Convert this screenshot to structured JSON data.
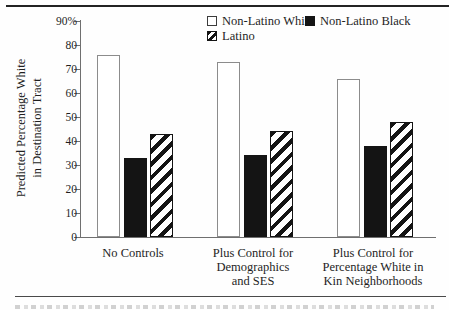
{
  "figure": {
    "type": "journal-figure",
    "colors": {
      "ink": "#1a1a1a",
      "axis_gray": "#6f6f6f",
      "bar_outline_gray": "#8c8c8c"
    }
  },
  "legend": {
    "position": "top-inside",
    "items": [
      {
        "label": "Non-Latino White",
        "swatch": "open"
      },
      {
        "label": "Non-Latino Black",
        "swatch": "solid"
      },
      {
        "label": "Latino",
        "swatch": "hatched"
      }
    ]
  },
  "axis": {
    "ylabel_line1": "Predicted Percentage White",
    "ylabel_line2": "in Destination Tract"
  },
  "chart_data": {
    "type": "bar",
    "title": "",
    "xlabel": "",
    "ylabel": "Predicted Percentage White in Destination Tract",
    "ylim": [
      0,
      90
    ],
    "ytick_interval": 10,
    "ytick_labels": [
      "90%",
      "80",
      "70",
      "60",
      "50",
      "40",
      "30",
      "20",
      "10",
      "0"
    ],
    "grid": false,
    "legend_position": "top",
    "categories": [
      "No Controls",
      "Plus Control for Demographics and SES",
      "Plus Control for Percentage White in Kin Neighborhoods"
    ],
    "categories_lines": [
      [
        "No Controls"
      ],
      [
        "Plus Control for",
        "Demographics",
        "and SES"
      ],
      [
        "Plus Control for",
        "Percentage White in",
        "Kin Neighborhoods"
      ]
    ],
    "series": [
      {
        "name": "Non-Latino White",
        "swatch": "open",
        "values": [
          76,
          73,
          66
        ]
      },
      {
        "name": "Non-Latino Black",
        "swatch": "solid",
        "values": [
          33,
          34,
          38
        ]
      },
      {
        "name": "Latino",
        "swatch": "hatched",
        "values": [
          43,
          44,
          48
        ]
      }
    ]
  }
}
